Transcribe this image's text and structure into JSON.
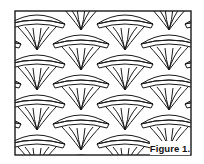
{
  "figure": {
    "label": "Figure 1.",
    "colors": {
      "line": "#1a1a1a",
      "background": "#ffffff"
    },
    "frame": {
      "x": 15,
      "y": 11,
      "width": 176,
      "height": 144
    },
    "grid": {
      "columns": 4,
      "column_width": 44,
      "row_period": 40,
      "column_offsets": [
        0,
        20,
        0,
        20
      ],
      "first_band_y": 12
    }
  }
}
